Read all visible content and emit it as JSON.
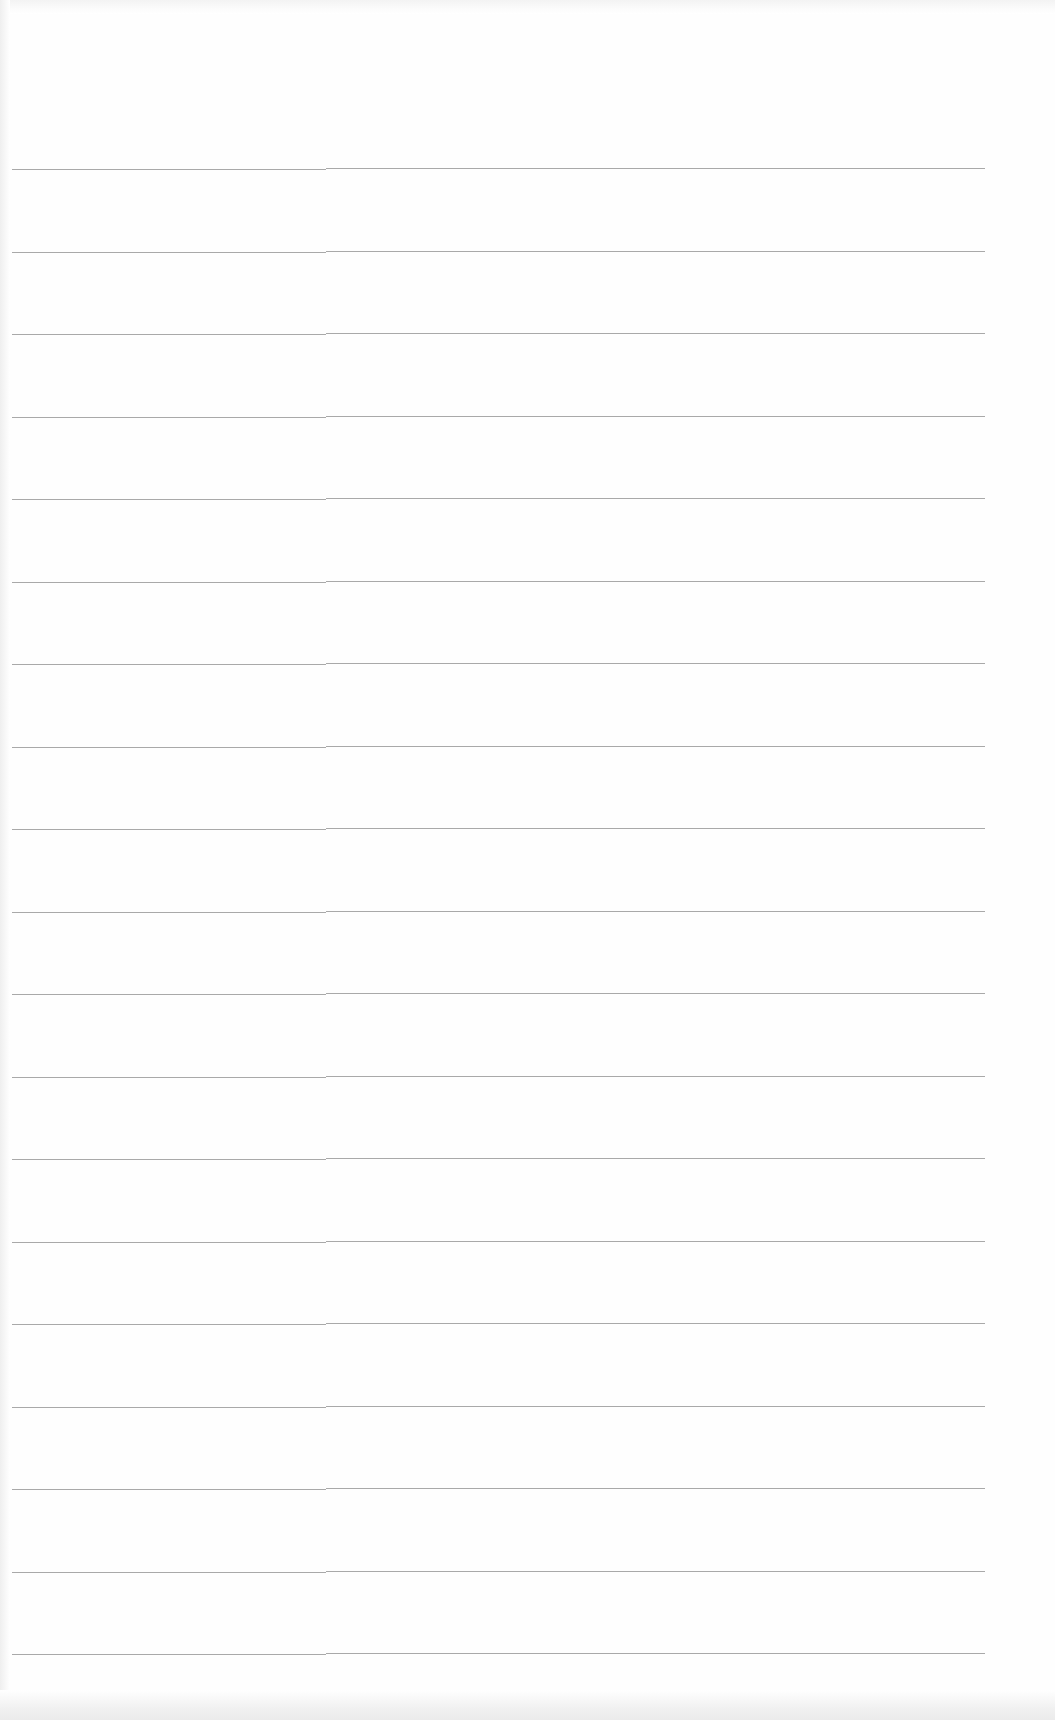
{
  "document": {
    "type": "blank lined paper",
    "text": "",
    "colors": {
      "paper": "#fefefe",
      "rule_line": "#9a9a9a"
    },
    "rules": {
      "count": 19,
      "first_y": 168,
      "spacing": 82.5,
      "left_x": 12,
      "right_x": 985,
      "step_x": 326
    }
  }
}
